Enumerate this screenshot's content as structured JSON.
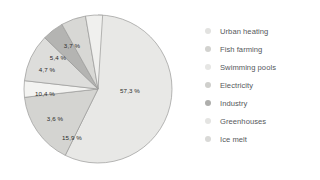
{
  "chart_data": {
    "type": "pie",
    "title": "",
    "subtitle": "",
    "xlabel": "",
    "ylabel": "",
    "legend_position": "right",
    "grid": false,
    "categories": [
      "Urban heating",
      "Fish farming",
      "Swimming pools",
      "Electricity",
      "Industry",
      "Greenhouses",
      "Ice melt"
    ],
    "values": [
      3.7,
      5.4,
      3.6,
      10.4,
      4.7,
      15.9,
      57.3
    ],
    "data_labels": [
      "3,7 %",
      "5,4 %",
      "3,6 %",
      "10,4 %",
      "4,7 %",
      "15,9 %",
      "57,3 %"
    ],
    "unit": "%",
    "slices": [
      {
        "label": "Ice melt",
        "value": 57.3,
        "data_label": "57,3 %",
        "color": "#e8e8e6",
        "start_angle": 0,
        "end_angle": 206.28,
        "label_x": 130,
        "label_y": 90
      },
      {
        "label": "Greenhouses",
        "value": 15.9,
        "data_label": "15,9 %",
        "color": "#d4d4d1",
        "start_angle": 206.28,
        "end_angle": 263.52,
        "label_x": 72,
        "label_y": 137
      },
      {
        "label": "Electricity",
        "value": 3.6,
        "data_label": "3,6 %",
        "color": "#f3f3f1",
        "start_angle": 263.52,
        "end_angle": 276.48,
        "label_x": 55,
        "label_y": 118
      },
      {
        "label": "Swimming pools",
        "value": 10.4,
        "data_label": "10,4 %",
        "color": "#dddddb",
        "start_angle": 276.48,
        "end_angle": 313.92,
        "label_x": 45,
        "label_y": 93
      },
      {
        "label": "Industry",
        "value": 4.7,
        "data_label": "4,7 %",
        "color": "#b4b4b2",
        "start_angle": 313.92,
        "end_angle": 330.84,
        "label_x": 47,
        "label_y": 69
      },
      {
        "label": "Fish farming",
        "value": 5.4,
        "data_label": "5,4 %",
        "color": "#d8d8d5",
        "start_angle": 330.84,
        "end_angle": 350.28,
        "label_x": 58,
        "label_y": 57
      },
      {
        "label": "Urban heating",
        "value": 3.7,
        "data_label": "3,7 %",
        "color": "#f0f0ee",
        "start_angle": 350.28,
        "end_angle": 363.6,
        "label_x": 72,
        "label_y": 45
      }
    ]
  },
  "legend": {
    "items": [
      {
        "label": "Urban heating",
        "color": "#e2e2e0"
      },
      {
        "label": "Fish farming",
        "color": "#d2d2cf"
      },
      {
        "label": "Swimming pools",
        "color": "#e6e6e4"
      },
      {
        "label": "Electricity",
        "color": "#cfcfcc"
      },
      {
        "label": "Industry",
        "color": "#aeaeac"
      },
      {
        "label": "Greenhouses",
        "color": "#e4e4e2"
      },
      {
        "label": "Ice melt",
        "color": "#d9d9d7"
      }
    ]
  },
  "style": {
    "background": "#ffffff",
    "slice_border": "#9a9a98",
    "label_color": "#2b2b2b",
    "legend_text_color": "#55585c"
  }
}
